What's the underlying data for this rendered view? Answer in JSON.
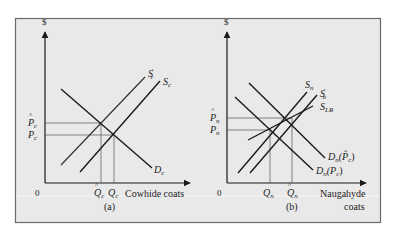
{
  "figure": {
    "background": "#e9e9e9",
    "frame_color": "#6a6a6a",
    "line_color": "#1a1a1a",
    "guide_color": "#555555"
  },
  "panel_a": {
    "caption": "(a)",
    "y_axis_label": "$",
    "origin_label": "0",
    "x_axis_label": "Cowhide coats",
    "price_ticks": [
      {
        "symbol": "P",
        "sub": "c",
        "hat": true,
        "name": "P-hat-c"
      },
      {
        "symbol": "P",
        "sub": "c",
        "hat": false,
        "name": "P-c"
      }
    ],
    "quantity_ticks": [
      {
        "symbol": "Q",
        "sub": "c",
        "hat": true,
        "name": "Q-hat-c"
      },
      {
        "symbol": "Q",
        "sub": "c",
        "hat": false,
        "name": "Q-c"
      }
    ],
    "curves": [
      {
        "name": "S_c'",
        "symbol": "S",
        "sub": "c",
        "prime": true,
        "type": "supply"
      },
      {
        "name": "S_c",
        "symbol": "S",
        "sub": "c",
        "prime": false,
        "type": "supply"
      },
      {
        "name": "D_c",
        "symbol": "D",
        "sub": "c",
        "prime": false,
        "type": "demand"
      }
    ]
  },
  "panel_b": {
    "caption": "(b)",
    "y_axis_label": "$",
    "origin_label": "0",
    "x_axis_label_line1": "Naugahyde",
    "x_axis_label_line2": "coats",
    "price_ticks": [
      {
        "symbol": "P",
        "sub": "n",
        "hat": true,
        "name": "P-hat-n"
      },
      {
        "symbol": "P",
        "sub": "n",
        "hat": false,
        "name": "P-n"
      }
    ],
    "quantity_ticks": [
      {
        "symbol": "Q",
        "sub": "n",
        "hat": false,
        "name": "Q-n"
      },
      {
        "symbol": "Q",
        "sub": "n",
        "hat": true,
        "name": "Q-hat-n"
      }
    ],
    "curves": [
      {
        "name": "S_n",
        "symbol": "S",
        "sub": "n",
        "prime": false,
        "type": "supply"
      },
      {
        "name": "S_n'",
        "symbol": "S",
        "sub": "n",
        "prime": true,
        "type": "supply"
      },
      {
        "name": "S_LR",
        "symbol": "S",
        "sub": "LR",
        "prime": false,
        "type": "long-run supply"
      },
      {
        "name": "D_n(P-hat_c)",
        "symbol": "D",
        "sub": "n",
        "arg": "(P̂",
        "arg_sub": "c",
        "arg_close": ")",
        "type": "demand"
      },
      {
        "name": "D_n(P_c)",
        "symbol": "D",
        "sub": "n",
        "arg": "(P",
        "arg_sub": "c",
        "arg_close": ")",
        "type": "demand"
      }
    ]
  }
}
